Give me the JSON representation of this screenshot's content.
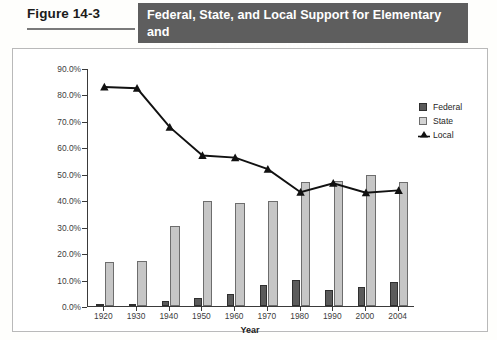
{
  "figure": {
    "label": "Figure 14-3",
    "title_line1": "Federal, State, and Local Support for Elementary and",
    "title_line2": "Secondary Education, 1920–2004 (in Percent)",
    "title_bar_color": "#5e5e5e"
  },
  "legend": {
    "position": "top-right",
    "items": [
      {
        "key": "federal",
        "label": "Federal",
        "color": "#5b5b5b",
        "marker": "filled-square"
      },
      {
        "key": "state",
        "label": "State",
        "color": "#d3d3d3",
        "marker": "light-square"
      },
      {
        "key": "local",
        "label": "Local",
        "color": "#111111",
        "marker": "triangle-line"
      }
    ]
  },
  "chart_data": {
    "type": "bar",
    "title": "Federal, State, and Local Support for Elementary and Secondary Education, 1920–2004 (in Percent)",
    "xlabel": "Year",
    "ylabel": "Percent",
    "ylim": [
      0,
      90
    ],
    "ytick_labels": [
      "0.0%",
      "10.0%",
      "20.0%",
      "30.0%",
      "40.0%",
      "50.0%",
      "60.0%",
      "70.0%",
      "80.0%",
      "90.0%"
    ],
    "ytick_values": [
      0,
      10,
      20,
      30,
      40,
      50,
      60,
      70,
      80,
      90
    ],
    "grid": false,
    "categories": [
      "1920",
      "1930",
      "1940",
      "1950",
      "1960",
      "1970",
      "1980",
      "1990",
      "2000",
      "2004"
    ],
    "series": [
      {
        "name": "Federal",
        "type": "bar",
        "color": "#5b5b5b",
        "values": [
          0.3,
          0.4,
          1.8,
          2.9,
          4.4,
          8.0,
          9.8,
          6.1,
          7.3,
          8.9
        ]
      },
      {
        "name": "State",
        "type": "bar",
        "color": "#c6c6c6",
        "values": [
          16.5,
          16.9,
          30.3,
          39.8,
          39.1,
          39.9,
          46.8,
          47.1,
          49.5,
          47.0
        ]
      },
      {
        "name": "Local",
        "type": "line",
        "color": "#111111",
        "values": [
          83.2,
          82.7,
          68.0,
          57.3,
          56.5,
          52.1,
          43.4,
          46.8,
          43.2,
          44.1
        ]
      }
    ]
  }
}
